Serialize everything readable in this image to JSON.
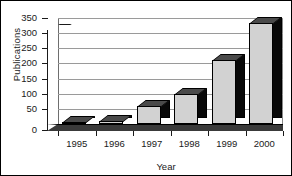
{
  "chart_data": {
    "type": "bar",
    "title": "",
    "xlabel": "Year",
    "ylabel": "Publications",
    "categories": [
      "1995",
      "1996",
      "1997",
      "1998",
      "1999",
      "2000"
    ],
    "values": [
      5,
      10,
      60,
      100,
      210,
      335
    ],
    "ylim": [
      0,
      350
    ],
    "yticks": [
      0,
      50,
      100,
      150,
      200,
      250,
      300,
      350
    ],
    "ytick_labels": [
      "0",
      "50",
      "100",
      "150",
      "200",
      "250",
      "300",
      "350"
    ],
    "grid": true,
    "legend": false,
    "style": "3d-bar",
    "colors": {
      "bar_front": "#d2d2d2",
      "bar_side": "#080808",
      "bar_top": "#4a4a4a",
      "gridline": "#9a9a9a",
      "axis": "#1a1a1a",
      "background": "#ffffff",
      "border": "#000000"
    }
  }
}
